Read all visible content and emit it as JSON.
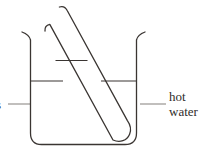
{
  "figure": {
    "kind": "science-diagram",
    "background_color": "#ffffff",
    "stroke_color": "#3a3532",
    "leader_color": "#8e8a88",
    "text_color": "#302c2a"
  },
  "labels": {
    "right": {
      "line1": "hot",
      "line2": "water"
    },
    "left": {
      "text": "s"
    }
  },
  "parts": {
    "beaker": "beaker",
    "beaker_water_surface": "water-level-line",
    "test_tube": "test-tube",
    "test_tube_contents_level": "test-tube-liquid-level",
    "leader_right": "leader-line-hot-water",
    "leader_left": "leader-line-left"
  }
}
